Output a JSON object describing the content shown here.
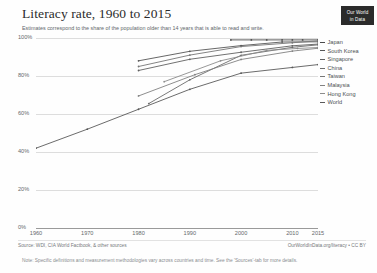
{
  "header": {
    "title": "Literacy rate, 1960 to 2015",
    "subtitle": "Estimates correspond to the share of the population older than 14 years that is able to read and write.",
    "logo_line1": "Our World",
    "logo_line2": "in Data"
  },
  "footer": {
    "source": "Source: WDI, CIA World Factbook, & other sources",
    "license": "OurWorldInData.org/literacy • CC BY",
    "note": "Note: Specific definitions and measurement methodologies vary across countries and time. See the 'Sources'-tab for more details."
  },
  "legend": {
    "items": [
      {
        "label": "Japan",
        "color": "#4b4b4b"
      },
      {
        "label": "South Korea",
        "color": "#565656"
      },
      {
        "label": "Singapore",
        "color": "#616161"
      },
      {
        "label": "China",
        "color": "#6b6b6b"
      },
      {
        "label": "Taiwan",
        "color": "#767676"
      },
      {
        "label": "Malaysia",
        "color": "#818181"
      },
      {
        "label": "Hong Kong",
        "color": "#8c8c8c"
      },
      {
        "label": "World",
        "color": "#5a5a5a"
      }
    ]
  },
  "chart_data": {
    "type": "line",
    "title": "Literacy rate, 1960 to 2015",
    "subtitle": "Estimates correspond to the share of the population older than 14 years that is able to read and write.",
    "xlabel": "",
    "ylabel": "",
    "xlim": [
      1960,
      2015
    ],
    "ylim": [
      0,
      100
    ],
    "grid": "horizontal",
    "legend_position": "right",
    "y_ticks": [
      "100%",
      "80%",
      "60%",
      "40%",
      "20%",
      "0%"
    ],
    "y_tick_values": [
      100,
      80,
      60,
      40,
      20,
      0
    ],
    "x_ticks": [
      "1960",
      "1970",
      "1980",
      "1990",
      "2000",
      "2010",
      "2015"
    ],
    "x_tick_values": [
      1960,
      1970,
      1980,
      1990,
      2000,
      2010,
      2015
    ],
    "series": [
      {
        "name": "Japan",
        "color": "#4b4b4b",
        "x": [
          1998,
          2002,
          2005,
          2008,
          2010,
          2012,
          2015
        ],
        "values": [
          99.0,
          99.0,
          99.0,
          99.0,
          99.0,
          99.0,
          99.0
        ]
      },
      {
        "name": "South Korea",
        "color": "#565656",
        "x": [
          1980,
          1990,
          2000,
          2008,
          2015
        ],
        "values": [
          88.0,
          93.0,
          96.0,
          97.9,
          98.0
        ]
      },
      {
        "name": "Singapore",
        "color": "#616161",
        "x": [
          1980,
          1990,
          2000,
          2010,
          2015
        ],
        "values": [
          82.9,
          88.8,
          92.5,
          95.9,
          96.8
        ]
      },
      {
        "name": "China",
        "color": "#6b6b6b",
        "x": [
          1982,
          1990,
          2000,
          2010,
          2015
        ],
        "values": [
          65.5,
          78.0,
          90.9,
          95.1,
          96.4
        ]
      },
      {
        "name": "Taiwan",
        "color": "#767676",
        "x": [
          1980,
          1990,
          2000,
          2010,
          2015
        ],
        "values": [
          85.0,
          91.0,
          95.5,
          97.5,
          98.5
        ]
      },
      {
        "name": "Malaysia",
        "color": "#818181",
        "x": [
          1980,
          1991,
          2000,
          2010,
          2015
        ],
        "values": [
          69.5,
          80.7,
          88.7,
          93.1,
          94.6
        ]
      },
      {
        "name": "Hong Kong",
        "color": "#8c8c8c",
        "x": [
          1985,
          1996,
          2005,
          2011,
          2015
        ],
        "values": [
          77.0,
          88.0,
          93.5,
          94.5,
          95.0
        ]
      },
      {
        "name": "World",
        "color": "#5a5a5a",
        "x": [
          1960,
          1970,
          1980,
          1990,
          2000,
          2010,
          2015
        ],
        "values": [
          42.0,
          52.0,
          62.5,
          73.0,
          81.5,
          84.5,
          86.0
        ]
      }
    ]
  }
}
